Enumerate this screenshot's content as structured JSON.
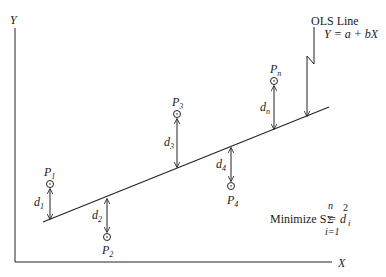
{
  "diagram": {
    "axes": {
      "x_label": "X",
      "y_label": "Y"
    },
    "ols_label": {
      "line1": "OLS Line",
      "line2": "Y = a + bX"
    },
    "points": [
      {
        "name": "P",
        "sub": "1",
        "dist": "d",
        "dist_sub": "1",
        "position": "above"
      },
      {
        "name": "P",
        "sub": "2",
        "dist": "d",
        "dist_sub": "2",
        "position": "below"
      },
      {
        "name": "P",
        "sub": "3",
        "dist": "d",
        "dist_sub": "3",
        "position": "above"
      },
      {
        "name": "P",
        "sub": "4",
        "dist": "d",
        "dist_sub": "4",
        "position": "below"
      },
      {
        "name": "P",
        "sub": "n",
        "dist": "d",
        "dist_sub": "n",
        "position": "above"
      }
    ],
    "formula": {
      "prefix": "Minimize S =",
      "sigma": "Σ",
      "upper": "n",
      "lower": "i=1",
      "term": "d",
      "exponent": "2",
      "index": "i"
    },
    "colors": {
      "stroke": "#222222",
      "background": "#ffffff"
    }
  }
}
